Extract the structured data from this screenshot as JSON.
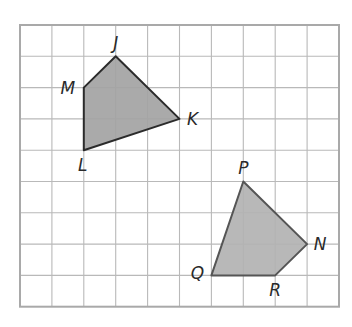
{
  "diagram": {
    "type": "coordinate-grid-figures",
    "grid": {
      "columns": 10,
      "rows": 9,
      "origin_px": [
        20,
        25
      ],
      "cell_w": 31.9,
      "cell_h": 31.3,
      "line_color": "#b9b9b9",
      "border_color": "#a9a9a9"
    },
    "figures": [
      {
        "name": "JKLM",
        "fill": "#a3a3a3",
        "stroke": "#2b2b2b",
        "vertices": [
          {
            "label": "J",
            "col": 3,
            "row": 1,
            "label_dx": 0,
            "label_dy": -7
          },
          {
            "label": "K",
            "col": 5,
            "row": 3,
            "label_dx": 13,
            "label_dy": 6
          },
          {
            "label": "L",
            "col": 2,
            "row": 4,
            "label_dx": -1,
            "label_dy": 21
          },
          {
            "label": "M",
            "col": 2,
            "row": 2,
            "label_dx": -16,
            "label_dy": 6
          }
        ]
      },
      {
        "name": "PNRQ",
        "fill": "#b2b2b2",
        "stroke": "#555555",
        "vertices": [
          {
            "label": "P",
            "col": 7,
            "row": 5,
            "label_dx": 0,
            "label_dy": -8
          },
          {
            "label": "N",
            "col": 9,
            "row": 7,
            "label_dx": 13,
            "label_dy": 6
          },
          {
            "label": "R",
            "col": 8,
            "row": 8,
            "label_dx": 0,
            "label_dy": 21
          },
          {
            "label": "Q",
            "col": 6,
            "row": 8,
            "label_dx": -14,
            "label_dy": 4
          }
        ]
      }
    ]
  }
}
